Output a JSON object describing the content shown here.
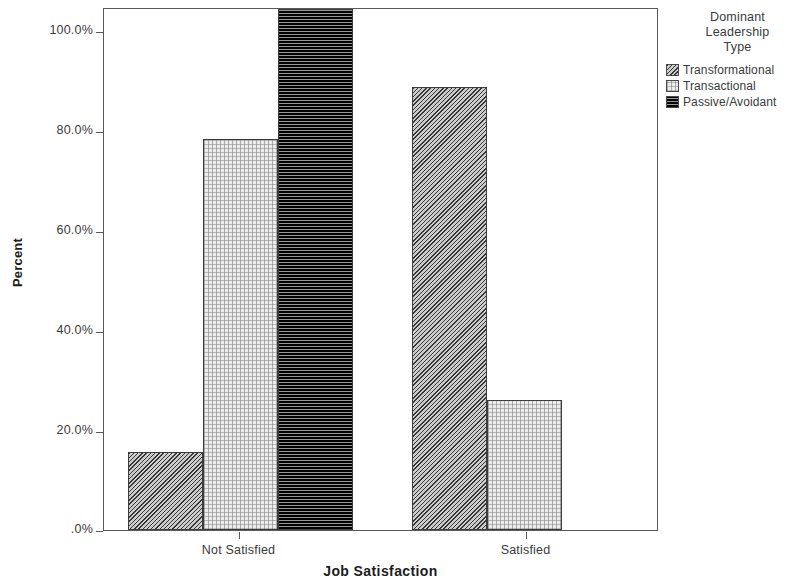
{
  "chart_data": {
    "type": "bar",
    "title": "",
    "xlabel": "Job Satisfaction",
    "ylabel": "Percent",
    "categories": [
      "Not Satisfied",
      "Satisfied"
    ],
    "series": [
      {
        "name": "Transformational",
        "values": [
          15,
          85
        ],
        "pattern": "diagonal-hatch",
        "color": "#8d8d8d"
      },
      {
        "name": "Transactional",
        "values": [
          75,
          25
        ],
        "pattern": "light-dotted",
        "color": "#ececec"
      },
      {
        "name": "Passive/Avoidant",
        "values": [
          100,
          0
        ],
        "pattern": "horizontal-lines",
        "color": "#262626"
      }
    ],
    "ylim": [
      0,
      100
    ],
    "yticks": [
      0,
      20,
      40,
      60,
      80,
      100
    ],
    "ytick_labels": [
      ".0%",
      "20.0%",
      "40.0%",
      "60.0%",
      "80.0%",
      "100.0%"
    ],
    "grid": false,
    "legend_position": "right",
    "legend_title": "Dominant Leadership Type",
    "value_unit": "percent"
  },
  "axes": {
    "y_title": "Percent",
    "x_title": "Job Satisfaction",
    "y_ticks": [
      {
        "label": "100.0%",
        "value": 100
      },
      {
        "label": "80.0%",
        "value": 80
      },
      {
        "label": "60.0%",
        "value": 60
      },
      {
        "label": "40.0%",
        "value": 40
      },
      {
        "label": "20.0%",
        "value": 20
      },
      {
        "label": ".0%",
        "value": 0
      }
    ],
    "x_groups": [
      {
        "label": "Not Satisfied"
      },
      {
        "label": "Satisfied"
      }
    ]
  },
  "legend": {
    "title_line1": "Dominant",
    "title_line2": "Leadership",
    "title_line3": "Type",
    "items": [
      {
        "label": "Transformational"
      },
      {
        "label": "Transactional"
      },
      {
        "label": "Passive/Avoidant"
      }
    ]
  },
  "bars": [
    {
      "group": "Not Satisfied",
      "series": "Transformational",
      "value": 15
    },
    {
      "group": "Not Satisfied",
      "series": "Transactional",
      "value": 75
    },
    {
      "group": "Not Satisfied",
      "series": "Passive/Avoidant",
      "value": 100
    },
    {
      "group": "Satisfied",
      "series": "Transformational",
      "value": 85
    },
    {
      "group": "Satisfied",
      "series": "Transactional",
      "value": 25
    }
  ]
}
